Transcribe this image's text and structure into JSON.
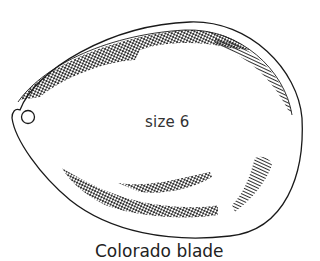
{
  "diagram": {
    "blade_label": "size 6",
    "caption": "Colorado blade",
    "colors": {
      "ink": "#1a1a1a",
      "background": "#ffffff"
    }
  }
}
